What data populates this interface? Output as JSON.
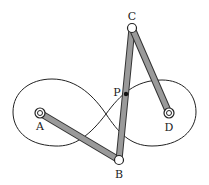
{
  "diagram": {
    "points": [
      {
        "id": "A",
        "label": "A",
        "x": 40,
        "y": 113,
        "type": "fixed-pivot"
      },
      {
        "id": "B",
        "label": "B",
        "x": 119,
        "y": 160,
        "type": "moving-joint"
      },
      {
        "id": "C",
        "label": "C",
        "x": 132,
        "y": 28,
        "type": "moving-joint"
      },
      {
        "id": "D",
        "label": "D",
        "x": 169,
        "y": 113,
        "type": "fixed-pivot"
      },
      {
        "id": "P",
        "label": "P",
        "x": 126,
        "y": 94,
        "type": "tracing-point"
      }
    ],
    "links": [
      {
        "from": "A",
        "to": "B"
      },
      {
        "from": "B",
        "to": "C"
      },
      {
        "from": "C",
        "to": "D"
      }
    ],
    "curve": "figure-eight",
    "colors": {
      "link_fill": "#9a9a9a",
      "link_stroke": "#333333",
      "curve": "#222222"
    }
  }
}
